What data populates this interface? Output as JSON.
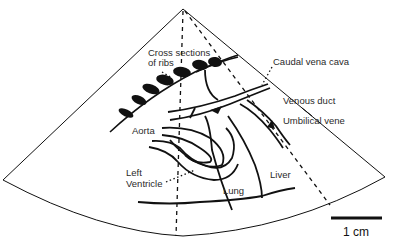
{
  "diagram": {
    "type": "ultrasound-sector-schematic",
    "labels": {
      "ribs_line1": "Cross sections",
      "ribs_line2": "of ribs",
      "caudal_vena_cava": "Caudal vena cava",
      "venous_duct": "Venous duct",
      "umbilical_vene": "Umbilical vene",
      "aorta": "Aorta",
      "left_ventricle_line1": "Left",
      "left_ventricle_line2": "Ventricle",
      "lung": "Lung",
      "liver": "Liver"
    },
    "scale_bar": {
      "label": "1 cm"
    },
    "colors": {
      "line": "#111111",
      "text": "#2a2a2a",
      "background": "#ffffff"
    }
  }
}
